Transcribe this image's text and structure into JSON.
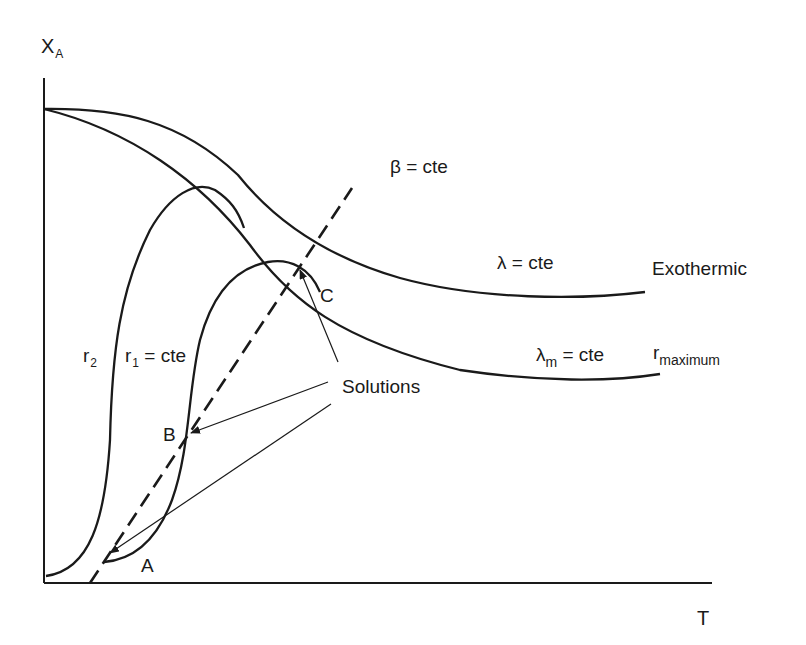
{
  "diagram": {
    "axes": {
      "y_label": "X",
      "y_label_sub": "A",
      "x_label": "T"
    },
    "curves": {
      "beta": {
        "symbol": "β",
        "text": " = cte"
      },
      "lambda": {
        "symbol": "λ",
        "text": " = cte"
      },
      "lambda_m": {
        "symbol": "λ",
        "sub": "m",
        "text": " = cte"
      },
      "exothermic": "Exothermic",
      "r_maximum": {
        "symbol": "r",
        "sub": "maximum"
      },
      "r1": {
        "symbol": "r",
        "sub": "1",
        "text": " = cte"
      },
      "r2": {
        "symbol": "r",
        "sub": "2"
      }
    },
    "points": {
      "A": "A",
      "B": "B",
      "C": "C"
    },
    "annotation": "Solutions",
    "colors": {
      "stroke": "#1a1a1a",
      "background": "#ffffff"
    }
  }
}
